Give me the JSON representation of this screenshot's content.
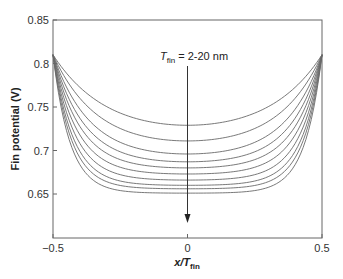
{
  "chart_data": {
    "type": "line",
    "title": "",
    "xlabel": "x/T_fin",
    "xlabel_parts": {
      "pre": "x/",
      "main": "T",
      "sub": "fin"
    },
    "ylabel": "Fin potential (V)",
    "xlim": [
      -0.5,
      0.5
    ],
    "ylim": [
      0.62,
      0.85
    ],
    "xticks": [
      -0.5,
      0,
      0.5
    ],
    "xtick_labels": [
      "−0.5",
      "0",
      "0.5"
    ],
    "yticks": [
      0.65,
      0.7,
      0.75,
      0.8,
      0.85
    ],
    "ytick_labels": [
      "0.65",
      "0.7",
      "0.75",
      "0.8",
      "0.85"
    ],
    "grid": false,
    "legend": null,
    "annotation": {
      "text_main": "T",
      "text_sub": "fin",
      "text_rest": " = 2-20 nm",
      "arrow": {
        "x": 0,
        "y_from": 0.81,
        "y_to": 0.627,
        "direction": "down"
      }
    },
    "edge_value": 0.81,
    "curve_shape": "symmetric U-shaped potential profile across fin; all curves meet at 0.81 V at x = ±0.5",
    "series": [
      {
        "name": "curve 1",
        "min_at_center": 0.729
      },
      {
        "name": "curve 2",
        "min_at_center": 0.711
      },
      {
        "name": "curve 3",
        "min_at_center": 0.696
      },
      {
        "name": "curve 4",
        "min_at_center": 0.687
      },
      {
        "name": "curve 5",
        "min_at_center": 0.68
      },
      {
        "name": "curve 6",
        "min_at_center": 0.673
      },
      {
        "name": "curve 7",
        "min_at_center": 0.666
      },
      {
        "name": "curve 8",
        "min_at_center": 0.66
      },
      {
        "name": "curve 9",
        "min_at_center": 0.656
      },
      {
        "name": "curve 10",
        "min_at_center": 0.651
      }
    ]
  },
  "colors": {
    "curve": "#6a6a6a",
    "axis": "#555555",
    "text": "#222222"
  }
}
